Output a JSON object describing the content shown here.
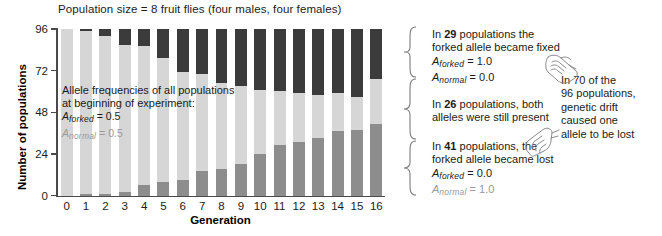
{
  "figure": {
    "title": "Population size = 8 fruit flies (four males, four females)",
    "x_title": "Generation",
    "y_title": "Number of populations"
  },
  "inplot_note": {
    "line1": "Allele frequencies of all populations",
    "line2": "at beginning of experiment:",
    "forked_symbol": "A",
    "forked_sub": "forked",
    "forked_eq": "= 0.5",
    "normal_symbol": "A",
    "normal_sub": "normal",
    "normal_eq": "= 0.5"
  },
  "annotations": {
    "fixed": {
      "line1_pre": "In ",
      "count": "29",
      "line1_post": " populations the",
      "line2": "forked allele became fixed",
      "forked_symbol": "A",
      "forked_sub": "forked",
      "forked_eq": "= 1.0",
      "normal_symbol": "A",
      "normal_sub": "normal",
      "normal_eq": "= 0.0"
    },
    "both": {
      "line1_pre": "In ",
      "count": "26",
      "line1_post": " populations, both",
      "line2": "alleles were still present"
    },
    "lost": {
      "line1_pre": "In ",
      "count": "41",
      "line1_post": " populations, the",
      "line2": "forked allele became lost",
      "forked_symbol": "A",
      "forked_sub": "forked",
      "forked_eq": "= 0.0",
      "normal_symbol": "A",
      "normal_sub": "normal",
      "normal_eq": "= 1.0"
    },
    "drift": {
      "line1": "In 70 of the",
      "line2": "96 populations,",
      "line3": "genetic drift",
      "line4": "caused one",
      "line5": "allele to be lost"
    }
  },
  "icons": {
    "hand_top": "pointing-hand-icon",
    "hand_bottom": "pointing-hand-icon"
  },
  "colors": {
    "seg_lost": "#8d8d8d",
    "seg_both": "#d6d6d6",
    "seg_fixed": "#3b3b3b",
    "axis": "#4a4a4a",
    "text": "#1b1b1b",
    "muted_text": "#9a9a9a"
  },
  "chart_data": {
    "type": "bar",
    "title": "Population size = 8 fruit flies (four males, four females)",
    "xlabel": "Generation",
    "ylabel": "Number of populations",
    "stacked": true,
    "grid": false,
    "legend": "none",
    "ylim": [
      0,
      96
    ],
    "yticks": [
      0,
      24,
      48,
      72,
      96
    ],
    "categories": [
      "0",
      "1",
      "2",
      "3",
      "4",
      "5",
      "6",
      "7",
      "8",
      "9",
      "10",
      "11",
      "12",
      "13",
      "14",
      "15",
      "16"
    ],
    "series": [
      {
        "name": "forked allele lost (A_forked = 0.0)",
        "color": "#8d8d8d",
        "values": [
          0,
          1,
          1,
          2,
          6,
          8,
          9,
          14,
          15,
          18,
          24,
          29,
          31,
          33,
          37,
          38,
          41
        ]
      },
      {
        "name": "both alleles still present",
        "color": "#d6d6d6",
        "values": [
          96,
          94,
          91,
          85,
          80,
          71,
          62,
          56,
          50,
          45,
          37,
          31,
          28,
          25,
          22,
          19,
          26
        ]
      },
      {
        "name": "forked allele fixed (A_forked = 1.0)",
        "color": "#3b3b3b",
        "values": [
          0,
          1,
          4,
          9,
          10,
          17,
          25,
          26,
          31,
          33,
          35,
          36,
          37,
          38,
          37,
          39,
          29
        ]
      }
    ],
    "annotations": [
      "In 29 populations the forked allele became fixed (A_forked = 1.0, A_normal = 0.0)",
      "In 26 populations, both alleles were still present",
      "In 41 populations, the forked allele became lost (A_forked = 0.0, A_normal = 1.0)",
      "In 70 of the 96 populations, genetic drift caused one allele to be lost",
      "Allele frequencies of all populations at beginning of experiment: A_forked = 0.5, A_normal = 0.5"
    ]
  }
}
